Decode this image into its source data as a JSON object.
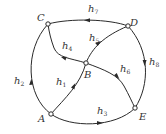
{
  "diagram": {
    "type": "directed-graph",
    "nodes": [
      {
        "id": "A",
        "label": "A",
        "x": 51,
        "y": 114
      },
      {
        "id": "B",
        "label": "B",
        "x": 86,
        "y": 63
      },
      {
        "id": "C",
        "label": "C",
        "x": 48,
        "y": 24
      },
      {
        "id": "D",
        "label": "D",
        "x": 128,
        "y": 26
      },
      {
        "id": "E",
        "label": "E",
        "x": 135,
        "y": 108
      }
    ],
    "edges": [
      {
        "id": "h1",
        "base": "h",
        "sub": "1",
        "from": "A",
        "to": "B"
      },
      {
        "id": "h2",
        "base": "h",
        "sub": "2",
        "from": "A",
        "to": "C"
      },
      {
        "id": "h3",
        "base": "h",
        "sub": "3",
        "from": "A",
        "to": "E"
      },
      {
        "id": "h4",
        "base": "h",
        "sub": "4",
        "from": "B",
        "to": "C"
      },
      {
        "id": "h5",
        "base": "h",
        "sub": "5",
        "from": "B",
        "to": "D"
      },
      {
        "id": "h6",
        "base": "h",
        "sub": "6",
        "from": "B",
        "to": "E"
      },
      {
        "id": "h7",
        "base": "h",
        "sub": "7",
        "from": "D",
        "to": "C"
      },
      {
        "id": "h8",
        "base": "h",
        "sub": "8",
        "from": "D",
        "to": "E"
      }
    ],
    "colors": {
      "line": "#2a2a2a",
      "node_fill": "#ffffff",
      "text": "#333333"
    }
  }
}
